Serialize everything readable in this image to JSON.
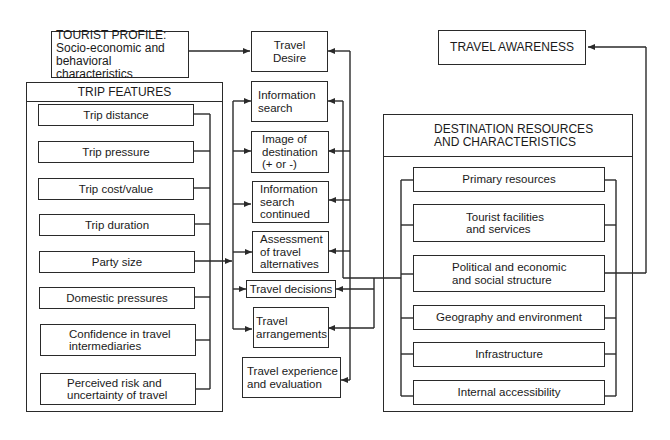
{
  "tourist_profile": {
    "title": "TOURIST PROFILE:",
    "subtitle": "Socio-economic and\nbehavioral characteristics"
  },
  "travel_awareness": {
    "label": "TRAVEL AWARENESS"
  },
  "trip_features": {
    "title": "TRIP FEATURES",
    "items": [
      {
        "label": "Trip distance"
      },
      {
        "label": "Trip pressure"
      },
      {
        "label": "Trip cost/value"
      },
      {
        "label": "Trip duration"
      },
      {
        "label": "Party size"
      },
      {
        "label": "Domestic pressures"
      },
      {
        "label": "Confidence in travel\nintermediaries"
      },
      {
        "label": "Perceived risk and\nuncertainty of travel"
      }
    ]
  },
  "process": {
    "steps": [
      {
        "label": "Travel\nDesire"
      },
      {
        "label": "Information\nsearch"
      },
      {
        "label": "Image of\ndestination\n(+ or -)"
      },
      {
        "label": "Information\nsearch\ncontinued"
      },
      {
        "label": "Assessment\nof travel\nalternatives"
      },
      {
        "label": "Travel decisions"
      },
      {
        "label": "Travel\narrangements"
      },
      {
        "label": "Travel experience\nand evaluation"
      }
    ]
  },
  "destination": {
    "title": "DESTINATION RESOURCES\nAND CHARACTERISTICS",
    "items": [
      {
        "label": "Primary resources"
      },
      {
        "label": "Tourist facilities\nand services"
      },
      {
        "label": "Political and economic\nand social structure"
      },
      {
        "label": "Geography and environment"
      },
      {
        "label": "Infrastructure"
      },
      {
        "label": "Internal accessibility"
      }
    ]
  },
  "colors": {
    "line": "#2a2a2a",
    "background": "#ffffff"
  }
}
